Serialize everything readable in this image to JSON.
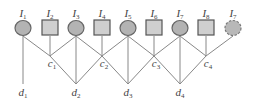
{
  "diagram": {
    "top_nodes": [
      {
        "id": "I1",
        "base": "I",
        "sub": "1",
        "shape": "circle",
        "x": 23
      },
      {
        "id": "I2",
        "base": "I",
        "sub": "2",
        "shape": "square",
        "x": 50
      },
      {
        "id": "I3",
        "base": "I",
        "sub": "3",
        "shape": "circle",
        "x": 76
      },
      {
        "id": "I4",
        "base": "I",
        "sub": "4",
        "shape": "square",
        "x": 102
      },
      {
        "id": "I5",
        "base": "I",
        "sub": "5",
        "shape": "circle",
        "x": 128
      },
      {
        "id": "I6",
        "base": "I",
        "sub": "6",
        "shape": "square",
        "x": 154
      },
      {
        "id": "I7",
        "base": "I",
        "sub": "7",
        "shape": "circle",
        "x": 180
      },
      {
        "id": "I8",
        "base": "I",
        "sub": "8",
        "shape": "square",
        "x": 206
      },
      {
        "id": "I7b",
        "base": "I",
        "sub": "7",
        "shape": "dashed-circle",
        "x": 233
      }
    ],
    "c_nodes": [
      {
        "id": "c1",
        "base": "c",
        "sub": "1",
        "x": 50
      },
      {
        "id": "c2",
        "base": "c",
        "sub": "2",
        "x": 102
      },
      {
        "id": "c3",
        "base": "c",
        "sub": "3",
        "x": 154
      },
      {
        "id": "c4",
        "base": "c",
        "sub": "4",
        "x": 206
      }
    ],
    "d_nodes": [
      {
        "id": "d1",
        "base": "d",
        "sub": "1",
        "x": 23
      },
      {
        "id": "d2",
        "base": "d",
        "sub": "2",
        "x": 76
      },
      {
        "id": "d3",
        "base": "d",
        "sub": "3",
        "x": 128
      },
      {
        "id": "d4",
        "base": "d",
        "sub": "4",
        "x": 180
      }
    ],
    "edges": [
      [
        "I1",
        "c1"
      ],
      [
        "I2",
        "c1"
      ],
      [
        "I3",
        "c1"
      ],
      [
        "I3",
        "c2"
      ],
      [
        "I4",
        "c2"
      ],
      [
        "I5",
        "c2"
      ],
      [
        "I5",
        "c3"
      ],
      [
        "I6",
        "c3"
      ],
      [
        "I7",
        "c3"
      ],
      [
        "I7",
        "c4"
      ],
      [
        "I8",
        "c4"
      ],
      [
        "I7b",
        "c4"
      ],
      [
        "I1",
        "d1"
      ],
      [
        "c1",
        "d2"
      ],
      [
        "I3",
        "d2"
      ],
      [
        "c2",
        "d2"
      ],
      [
        "c2",
        "d3"
      ],
      [
        "I5",
        "d3"
      ],
      [
        "c3",
        "d3"
      ],
      [
        "c3",
        "d4"
      ],
      [
        "I7",
        "d4"
      ],
      [
        "c4",
        "d4"
      ]
    ]
  }
}
